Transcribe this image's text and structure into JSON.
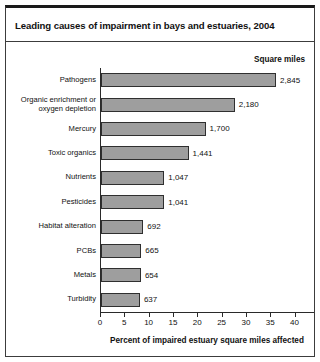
{
  "figure": {
    "title": "Leading causes of impairment in bays and estuaries, 2004",
    "value_column_header": "Square miles",
    "x_axis_title": "Percent of impaired estuary square miles affected",
    "note": "Note: Percents do not add up to 100% because more than one cause may affect a"
  },
  "chart_data": {
    "type": "bar",
    "orientation": "horizontal",
    "title": "Leading causes of impairment in bays and estuaries, 2004",
    "xlabel": "Percent of impaired estuary square miles affected",
    "ylabel": "",
    "xlim": [
      0,
      44
    ],
    "xticks": [
      0,
      5,
      10,
      15,
      20,
      25,
      30,
      35,
      40
    ],
    "xtick_labels": [
      "0",
      "5",
      "10",
      "15",
      "20",
      "25",
      "30",
      "35",
      "40"
    ],
    "grid": false,
    "legend": null,
    "value_label_header": "Square miles",
    "categories": [
      "Pathogens",
      "Organic enrichment or\noxygen depletion",
      "Mercury",
      "Toxic organics",
      "Nutrients",
      "Pesticides",
      "Habitat alteration",
      "PCBs",
      "Metals",
      "Turbidity"
    ],
    "values": [
      36.0,
      27.5,
      21.5,
      18.0,
      13.0,
      13.0,
      8.7,
      8.3,
      8.2,
      8.0
    ],
    "value_labels": [
      "2,845",
      "2,180",
      "1,700",
      "1,441",
      "1,047",
      "1,041",
      "692",
      "665",
      "654",
      "637"
    ],
    "square_miles": [
      2845,
      2180,
      1700,
      1441,
      1047,
      1041,
      692,
      665,
      654,
      637
    ],
    "bar_color": "#9e9e9e",
    "bar_edge_color": "#2f2f2f",
    "note": "Note: Percents do not add up to 100% because more than one cause may affect a"
  }
}
